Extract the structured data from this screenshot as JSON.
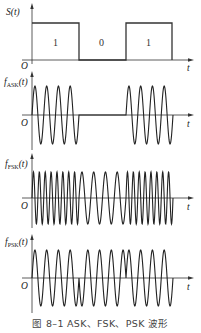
{
  "caption": "图 8–1   ASK、FSK、PSK 波形",
  "panels": {
    "s": {
      "ylabel": "S(t)",
      "origin": "O",
      "xlabel": "t",
      "bits": [
        "1",
        "0",
        "1"
      ]
    },
    "ask": {
      "ylabel_main": "f",
      "ylabel_sub": "ASK",
      "ylabel_tail": "(t)",
      "origin": "O",
      "xlabel": "t"
    },
    "fsk": {
      "ylabel_main": "f",
      "ylabel_sub": "FSK",
      "ylabel_tail": "(t)",
      "origin": "O",
      "xlabel": "t"
    },
    "psk": {
      "ylabel_main": "f",
      "ylabel_sub": "PSK",
      "ylabel_tail": "(t)",
      "origin": "O",
      "xlabel": "t"
    }
  },
  "signal": {
    "bit_sequence": [
      1,
      0,
      1
    ],
    "bit_width_px": 47,
    "ask_cycles_per_bit": 4,
    "fsk_cycles_per_bit_1": 8,
    "fsk_cycles_per_bit_0": 4,
    "psk_cycles_per_bit": 4
  },
  "colors": {
    "line": "#222222",
    "axis": "#333333",
    "background": "#ffffff"
  }
}
